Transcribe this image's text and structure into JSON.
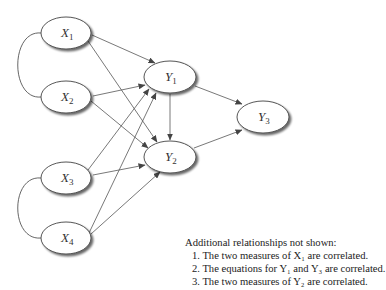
{
  "diagram": {
    "nodes": [
      {
        "id": "X1",
        "base": "X",
        "sub": "1",
        "cx": 66,
        "cy": 33
      },
      {
        "id": "X2",
        "base": "X",
        "sub": "2",
        "cx": 66,
        "cy": 97
      },
      {
        "id": "X3",
        "base": "X",
        "sub": "3",
        "cx": 66,
        "cy": 178
      },
      {
        "id": "X4",
        "base": "X",
        "sub": "4",
        "cx": 66,
        "cy": 238
      },
      {
        "id": "Y1",
        "base": "Y",
        "sub": "1",
        "cx": 170,
        "cy": 78
      },
      {
        "id": "Y2",
        "base": "Y",
        "sub": "2",
        "cx": 170,
        "cy": 157
      },
      {
        "id": "Y3",
        "base": "Y",
        "sub": "3",
        "cx": 263,
        "cy": 118
      }
    ],
    "edges": [
      [
        "X1",
        "Y1"
      ],
      [
        "X1",
        "Y2"
      ],
      [
        "X2",
        "Y1"
      ],
      [
        "X2",
        "Y2"
      ],
      [
        "X3",
        "Y1"
      ],
      [
        "X3",
        "Y2"
      ],
      [
        "X4",
        "Y1"
      ],
      [
        "X4",
        "Y2"
      ],
      [
        "Y1",
        "Y2"
      ],
      [
        "Y1",
        "Y3"
      ],
      [
        "Y2",
        "Y3"
      ]
    ],
    "correlations": [
      [
        "X1",
        "X2"
      ],
      [
        "X3",
        "X4"
      ]
    ]
  },
  "notes": {
    "title": "Additional relationships not shown:",
    "items": [
      "1. The two measures of X₁ are correlated.",
      "2. The equations for Y₁ and Y₃ are correlated.",
      "3. The two measures of Y₂ are correlated."
    ]
  }
}
